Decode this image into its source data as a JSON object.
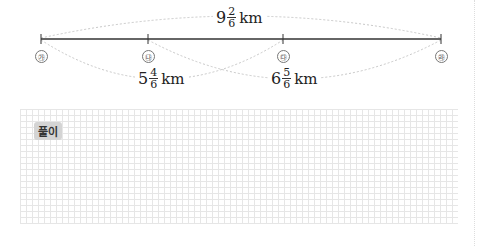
{
  "diagram": {
    "points": [
      {
        "label": "㉮",
        "x": 41
      },
      {
        "label": "㉯",
        "x": 148
      },
      {
        "label": "㉰",
        "x": 283
      },
      {
        "label": "㉱",
        "x": 441
      }
    ],
    "distances": {
      "total": {
        "from": "㉮",
        "to": "㉱",
        "whole": "9",
        "numerator": "2",
        "denominator": "6",
        "unit": "km"
      },
      "ga_da": {
        "from": "㉮",
        "to": "㉰",
        "whole": "5",
        "numerator": "4",
        "denominator": "6",
        "unit": "km"
      },
      "na_ra": {
        "from": "㉯",
        "to": "㉱",
        "whole": "6",
        "numerator": "5",
        "denominator": "6",
        "unit": "km"
      }
    }
  },
  "solution": {
    "tag": "풀이"
  }
}
